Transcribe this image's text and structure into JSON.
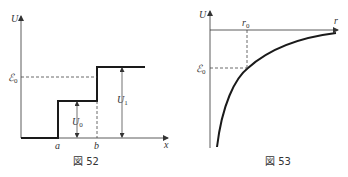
{
  "figures": [
    {
      "caption": "図 52",
      "y_axis_label": "U",
      "x_axis_label": "x",
      "x_ticks": [
        "a",
        "b"
      ],
      "energy_label": "ℰ",
      "energy_sub": "0",
      "u0_label": "U",
      "u0_sub": "0",
      "u1_label": "U",
      "u1_sub": "1"
    },
    {
      "caption": "図 53",
      "y_axis_label": "U",
      "x_axis_label": "r",
      "r0_label": "r",
      "r0_sub": "0",
      "energy_label": "ℰ",
      "energy_sub": "0"
    }
  ],
  "colors": {
    "line": "#1a1a1a",
    "dash": "#444444",
    "text": "#333333"
  }
}
